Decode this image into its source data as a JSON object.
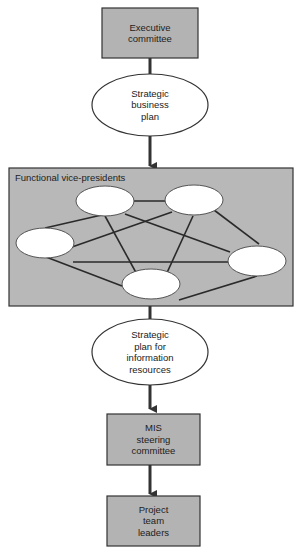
{
  "colors": {
    "box_fill": "#b3b3b3",
    "panel_fill": "#b8b8b8",
    "ellipse_fill": "#ffffff",
    "stroke": "#333333"
  },
  "nodes": {
    "executive_committee": "Executive committee",
    "strategic_business_plan": "Strategic business plan",
    "functional_vps_panel": "Functional vice-presidents",
    "strategic_plan_info": "Strategic plan for information resources",
    "mis_steering_committee": "MIS steering committee",
    "project_team_leaders": "Project team leaders"
  },
  "lines": {
    "exec": [
      "Executive",
      "committee"
    ],
    "sbp": [
      "Strategic",
      "business",
      "plan"
    ],
    "spi": [
      "Strategic",
      "plan for",
      "information",
      "resources"
    ],
    "mis": [
      "MIS",
      "steering",
      "committee"
    ],
    "ptl": [
      "Project",
      "team",
      "leaders"
    ]
  }
}
